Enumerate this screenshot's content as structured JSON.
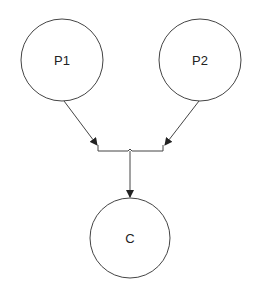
{
  "diagram": {
    "type": "family-tree",
    "nodes": [
      {
        "id": "P1",
        "label": "P1",
        "cx": 62,
        "cy": 60,
        "r": 41
      },
      {
        "id": "P2",
        "label": "P2",
        "cx": 200,
        "cy": 60,
        "r": 41
      },
      {
        "id": "C",
        "label": "C",
        "cx": 130,
        "cy": 238,
        "r": 40
      }
    ],
    "edges": [
      {
        "from": "P1",
        "to": "junction"
      },
      {
        "from": "P2",
        "to": "junction"
      },
      {
        "from": "junction",
        "to": "C"
      }
    ],
    "colors": {
      "stroke": "#444444",
      "background": "#ffffff"
    }
  }
}
